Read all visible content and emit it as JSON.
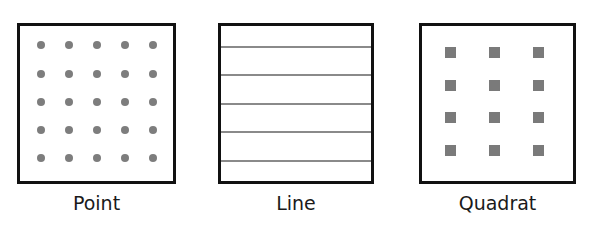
{
  "panels": [
    {
      "id": "point",
      "label": "Point",
      "pattern": "5x5 grid of circular dots"
    },
    {
      "id": "line",
      "label": "Line",
      "pattern": "5 evenly spaced horizontal lines"
    },
    {
      "id": "quadrat",
      "label": "Quadrat",
      "pattern": "3 columns x 4 rows of small squares"
    }
  ],
  "colors": {
    "border": "#111111",
    "marker": "#7d7d7d",
    "background": "#ffffff"
  }
}
